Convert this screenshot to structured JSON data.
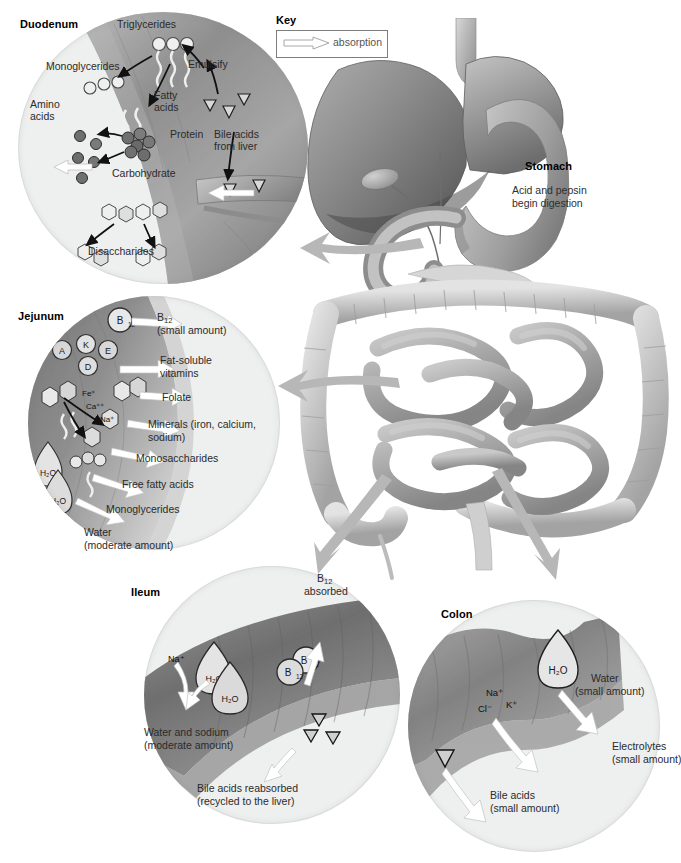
{
  "figure": {
    "key": {
      "title": "Key",
      "legend_label": "absorption",
      "arrow_icon": "absorption-arrow-icon"
    }
  },
  "anatomy": {
    "stomach": {
      "title": "Stomach",
      "description_line1": "Acid and pepsin",
      "description_line2": "begin digestion"
    },
    "organs": [
      "liver",
      "gallbladder",
      "stomach",
      "duodenum",
      "small-intestine",
      "colon",
      "rectum"
    ]
  },
  "regions": [
    {
      "id": "duodenum",
      "title": "Duodenum",
      "labels": [
        {
          "name": "triglycerides",
          "text": "Triglycerides"
        },
        {
          "name": "monoglycerides",
          "text": "Monoglycerides"
        },
        {
          "name": "emulsify",
          "text": "Emulsify"
        },
        {
          "name": "amino-acids",
          "text": "Amino\nacids"
        },
        {
          "name": "fatty-acids",
          "text": "Fatty\nacids"
        },
        {
          "name": "protein",
          "text": "Protein"
        },
        {
          "name": "bile-acids-from-liver",
          "text": "Bile acids\nfrom liver"
        },
        {
          "name": "carbohydrate",
          "text": "Carbohydrate"
        },
        {
          "name": "disaccharides",
          "text": "Disaccharides"
        }
      ]
    },
    {
      "id": "jejunum",
      "title": "Jejunum",
      "molecule_markers": [
        "B12",
        "A",
        "K",
        "E",
        "D"
      ],
      "ion_markers": [
        "Fe+",
        "Ca++",
        "Na+",
        "H2O",
        "H2O"
      ],
      "absorbed": [
        {
          "name": "b12",
          "line1": "B12",
          "line2": "(small amount)"
        },
        {
          "name": "fat-soluble-vitamins",
          "line1": "Fat-soluble",
          "line2": "vitamins"
        },
        {
          "name": "folate",
          "line1": "Folate",
          "line2": ""
        },
        {
          "name": "minerals",
          "line1": "Minerals (iron, calcium,",
          "line2": "sodium)"
        },
        {
          "name": "monosaccharides",
          "line1": "Monosaccharides",
          "line2": ""
        },
        {
          "name": "free-fatty-acids",
          "line1": "Free fatty acids",
          "line2": ""
        },
        {
          "name": "monoglycerides",
          "line1": "Monoglycerides",
          "line2": ""
        },
        {
          "name": "water",
          "line1": "Water",
          "line2": "(moderate amount)"
        }
      ]
    },
    {
      "id": "ileum",
      "title": "Ileum",
      "markers": [
        "Na+",
        "H2O",
        "H2O",
        "B12",
        "B12"
      ],
      "absorbed": [
        {
          "name": "b12-absorbed",
          "line1": "B12",
          "line2": "absorbed"
        },
        {
          "name": "water-and-sodium",
          "line1": "Water and sodium",
          "line2": "(moderate amount)"
        },
        {
          "name": "bile-acids-reabsorbed",
          "line1": "Bile acids reabsorbed",
          "line2": "(recycled to the liver)"
        }
      ]
    },
    {
      "id": "colon",
      "title": "Colon",
      "markers": [
        "H2O",
        "Na+",
        "Cl-",
        "K+"
      ],
      "absorbed": [
        {
          "name": "water",
          "line1": "Water",
          "line2": "(small amount)"
        },
        {
          "name": "electrolytes",
          "line1": "Electrolytes",
          "line2": "(small amount)"
        },
        {
          "name": "bile-acids",
          "line1": "Bile acids",
          "line2": "(small amount)"
        }
      ]
    }
  ],
  "colors": {
    "page_background": "#ffffff",
    "circle_fill": "#eeefef",
    "tissue_dark": "#6e6e6e",
    "tissue_mid": "#9a9a9a",
    "tissue_light": "#c9c9c9",
    "organ_liver": "#8a8a8a",
    "organ_intestine": "#c0c0c0",
    "pointer_arrow": "#b3b3b3",
    "absorption_arrow": "#ffffff",
    "text": "#2b2b2b",
    "title_text": "#000000"
  }
}
